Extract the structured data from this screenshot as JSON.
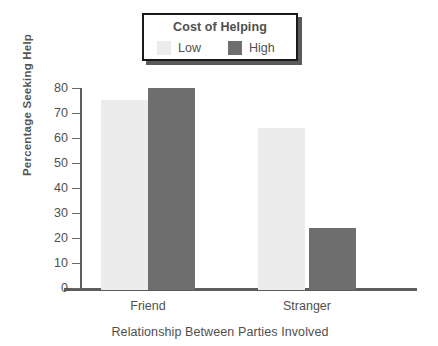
{
  "chart_data": {
    "type": "bar",
    "title": "",
    "categories": [
      "Friend",
      "Stranger"
    ],
    "series": [
      {
        "name": "Low",
        "values": [
          76,
          65
        ],
        "color": "#ececec"
      },
      {
        "name": "High",
        "values": [
          81,
          25
        ],
        "color": "#6e6e6e"
      }
    ],
    "xlabel": "Relationship Between Parties Involved",
    "ylabel": "Percentage Seeking Help",
    "ylim": [
      0,
      80
    ],
    "ytick_labels": [
      "80",
      "70",
      "60",
      "50",
      "40",
      "30",
      "20",
      "10",
      "0"
    ],
    "ytick_values": [
      80,
      70,
      60,
      50,
      40,
      30,
      20,
      10,
      0
    ],
    "grid": false,
    "legend_position": "top-center"
  },
  "legend": {
    "title": "Cost of Helping",
    "entries": [
      {
        "label": "Low",
        "color": "#ececec"
      },
      {
        "label": "High",
        "color": "#6e6e6e"
      }
    ]
  },
  "axes": {
    "y_title": "Percentage Seeking Help",
    "x_title": "Relationship Between Parties Involved"
  }
}
